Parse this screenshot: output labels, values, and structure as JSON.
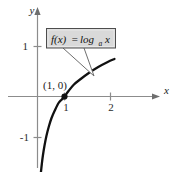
{
  "chart_data": {
    "type": "line",
    "title": "",
    "xlabel": "x",
    "ylabel": "y",
    "function_label": "f(x) = log_a x",
    "function_label_parts": {
      "fx": "f(x)",
      "equals": "=",
      "log": "log",
      "base": "a",
      "arg": "x"
    },
    "xlim": [
      -0.35,
      2.95
    ],
    "ylim": [
      -1.65,
      1.6
    ],
    "xticks": [
      1,
      2
    ],
    "xtick_labels": [
      "1",
      "2"
    ],
    "yticks": [
      1,
      -1
    ],
    "ytick_labels": [
      "1",
      "-1"
    ],
    "grid": false,
    "legend": "none",
    "annotations": [
      {
        "name": "intercept-label",
        "text": "(1, 0)",
        "x": 1,
        "y": 0
      }
    ],
    "points": [
      {
        "name": "x-intercept",
        "x": 1,
        "y": 0,
        "marker": "filled-circle"
      }
    ],
    "series": [
      {
        "name": "log_a x",
        "x": [
          0.12,
          0.16,
          0.2,
          0.26,
          0.33,
          0.42,
          0.52,
          0.64,
          0.78,
          0.9,
          1.0,
          1.15,
          1.35,
          1.6,
          1.9,
          2.25,
          2.6,
          2.85
        ],
        "y": [
          -1.55,
          -1.35,
          -1.18,
          -0.98,
          -0.79,
          -0.6,
          -0.43,
          -0.28,
          -0.13,
          -0.06,
          0.0,
          0.11,
          0.24,
          0.35,
          0.47,
          0.59,
          0.69,
          0.75
        ]
      }
    ],
    "colors": {
      "axis": "#8c8c8c",
      "curve": "#111111",
      "callout_fill": "#d9d9d9",
      "callout_border": "#4d4d4d",
      "leader": "#6e6e6e",
      "text": "#111111",
      "background": "#ffffff"
    }
  },
  "callout": {
    "name": "function-callout",
    "label": "f(x) = log_a x"
  }
}
